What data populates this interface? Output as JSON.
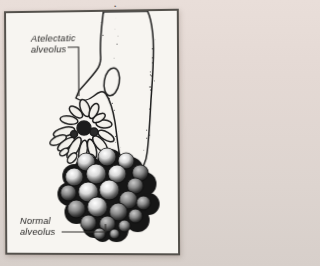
{
  "page": {
    "caption_fragment": "g gas exchange",
    "background_color": "#e4d9d4",
    "panel_background": "#f7f5f1",
    "panel_border_color": "#54514c",
    "ink_color": "#1c1c1c"
  },
  "figure": {
    "label_atelectatic_line1": "Atelectatic",
    "label_atelectatic_line2": "alveolus",
    "label_normal_line1": "Normal",
    "label_normal_line2": "alveolus"
  }
}
